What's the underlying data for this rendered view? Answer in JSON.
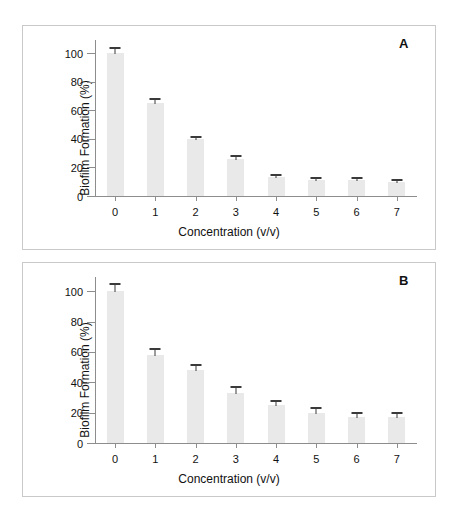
{
  "figure": {
    "background_color": "#ffffff",
    "bar_color": "#e9e9e9",
    "error_bar_color": "#3a3a3a",
    "axis_color": "#8d8d8d",
    "frame_color": "#c9c9c9"
  },
  "panels": [
    {
      "label": "A",
      "chart_data": {
        "type": "bar",
        "title": "",
        "xlabel": "Concentration (v/v)",
        "ylabel": "Biofilm Formation (%)",
        "categories": [
          "0",
          "1",
          "2",
          "3",
          "4",
          "5",
          "6",
          "7"
        ],
        "values": [
          100,
          65,
          40,
          26,
          13,
          11,
          11,
          10
        ],
        "errors": [
          4,
          3,
          1.5,
          2,
          2,
          1.5,
          1.5,
          1.5
        ],
        "ylim": [
          0,
          110
        ],
        "yticks": [
          0,
          20,
          40,
          60,
          80,
          100
        ],
        "ytick_labels": [
          "0",
          "20",
          "40",
          "60",
          "80",
          "100"
        ],
        "grid": false,
        "legend": "none"
      }
    },
    {
      "label": "B",
      "chart_data": {
        "type": "bar",
        "title": "",
        "xlabel": "Concentration (v/v)",
        "ylabel": "Biofilm Formation (%)",
        "categories": [
          "0",
          "1",
          "2",
          "3",
          "4",
          "5",
          "6",
          "7"
        ],
        "values": [
          100,
          58,
          48,
          33,
          25,
          20,
          17,
          17
        ],
        "errors": [
          5,
          4,
          3.5,
          4,
          3,
          3,
          3,
          3
        ],
        "ylim": [
          0,
          110
        ],
        "yticks": [
          0,
          20,
          40,
          60,
          80,
          100
        ],
        "ytick_labels": [
          "0",
          "20",
          "40",
          "60",
          "80",
          "100"
        ],
        "grid": false,
        "legend": "none"
      }
    }
  ]
}
